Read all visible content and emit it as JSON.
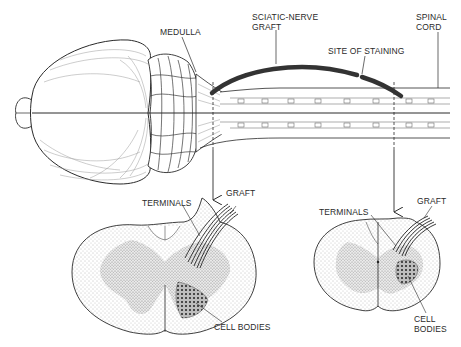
{
  "figure": {
    "colors": {
      "ink": "#2a2a2a",
      "graft": "#333333",
      "stipple": "#9a9a9a",
      "background": "#ffffff"
    }
  },
  "top_view": {
    "labels": {
      "medulla": "MEDULLA",
      "graft_line1": "SCIATIC-NERVE",
      "graft_line2": "GRAFT",
      "site_of_staining": "SITE OF STAINING",
      "spinal_line1": "SPINAL",
      "spinal_line2": "CORD"
    }
  },
  "cross_section_left": {
    "labels": {
      "terminals": "TERMINALS",
      "graft": "GRAFT",
      "cell_bodies": "CELL BODIES"
    }
  },
  "cross_section_right": {
    "labels": {
      "terminals": "TERMINALS",
      "graft": "GRAFT",
      "cell_line1": "CELL",
      "cell_line2": "BODIES"
    }
  }
}
